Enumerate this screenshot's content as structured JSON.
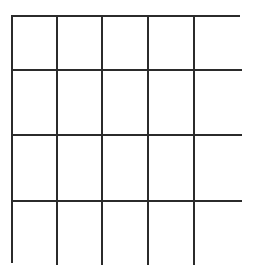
{
  "grid": {
    "columns": 5,
    "rows": 4,
    "line_color": "#2b2b2b",
    "background_color": "#ffffff",
    "cells": [
      [
        "",
        "",
        "",
        "",
        ""
      ],
      [
        "",
        "",
        "",
        "",
        ""
      ],
      [
        "",
        "",
        "",
        "",
        ""
      ],
      [
        "",
        "",
        "",
        "",
        ""
      ]
    ]
  }
}
